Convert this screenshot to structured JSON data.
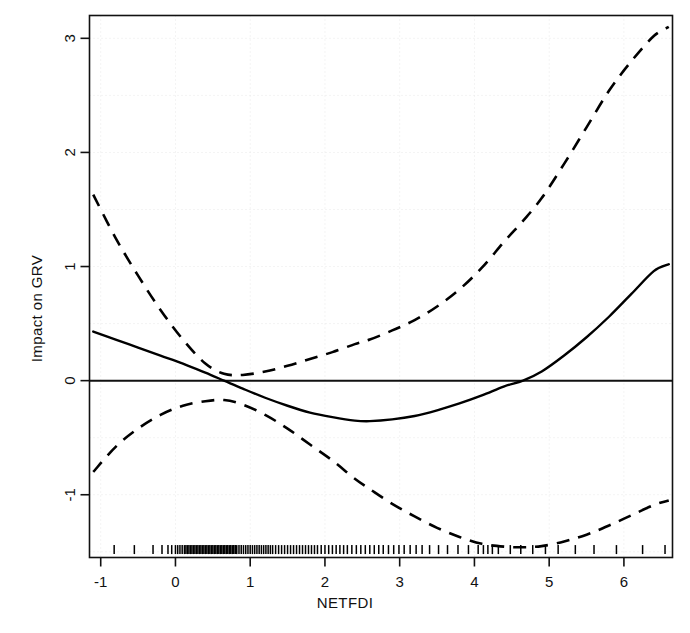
{
  "chart_data": {
    "type": "line",
    "title": "",
    "xlabel": "NETFDI",
    "ylabel": "Impact on GRV",
    "xlim": [
      -1.15,
      6.65
    ],
    "ylim": [
      -1.55,
      3.2
    ],
    "xticks": [
      -1,
      0,
      1,
      2,
      3,
      4,
      5,
      6
    ],
    "xticklabels": [
      "-1",
      "0",
      "1",
      "2",
      "3",
      "4",
      "5",
      "6"
    ],
    "yticks": [
      -1,
      0,
      1,
      2,
      3
    ],
    "yticklabels": [
      "-1",
      "0",
      "1",
      "2",
      "3"
    ],
    "grid": true,
    "grid_color": "#e8e8e8",
    "grid_style": "dotted",
    "legend": "none",
    "zero_line": 0,
    "x": [
      -1.1,
      -0.8,
      -0.5,
      -0.2,
      0.1,
      0.4,
      0.65,
      0.9,
      1.2,
      1.5,
      1.8,
      2.1,
      2.4,
      2.6,
      2.9,
      3.2,
      3.5,
      3.8,
      4.1,
      4.4,
      4.65,
      4.9,
      5.2,
      5.5,
      5.8,
      6.1,
      6.4,
      6.6
    ],
    "series": [
      {
        "name": "fitted effect",
        "style": "solid",
        "color": "#000000",
        "values": [
          0.43,
          0.36,
          0.29,
          0.22,
          0.15,
          0.07,
          0.0,
          -0.07,
          -0.15,
          -0.22,
          -0.28,
          -0.32,
          -0.35,
          -0.355,
          -0.34,
          -0.31,
          -0.26,
          -0.2,
          -0.13,
          -0.05,
          0.0,
          0.08,
          0.22,
          0.38,
          0.56,
          0.76,
          0.96,
          1.02
        ]
      },
      {
        "name": "upper confidence band",
        "style": "dashed",
        "color": "#000000",
        "values": [
          1.63,
          1.25,
          0.92,
          0.62,
          0.36,
          0.15,
          0.06,
          0.05,
          0.08,
          0.13,
          0.19,
          0.25,
          0.32,
          0.36,
          0.44,
          0.53,
          0.65,
          0.8,
          0.99,
          1.22,
          1.4,
          1.6,
          1.9,
          2.22,
          2.54,
          2.8,
          3.02,
          3.1
        ]
      },
      {
        "name": "lower confidence band",
        "style": "dashed",
        "color": "#000000",
        "values": [
          -0.8,
          -0.58,
          -0.42,
          -0.3,
          -0.22,
          -0.18,
          -0.17,
          -0.21,
          -0.3,
          -0.42,
          -0.56,
          -0.7,
          -0.86,
          -0.95,
          -1.08,
          -1.19,
          -1.29,
          -1.37,
          -1.43,
          -1.455,
          -1.46,
          -1.45,
          -1.41,
          -1.35,
          -1.27,
          -1.18,
          -1.09,
          -1.05
        ]
      }
    ],
    "rug": {
      "name": "data rug",
      "y": -1.52,
      "values": [
        -0.82,
        -0.55,
        -0.3,
        -0.18,
        -0.1,
        -0.05,
        0.0,
        0.03,
        0.06,
        0.09,
        0.12,
        0.14,
        0.16,
        0.18,
        0.2,
        0.22,
        0.24,
        0.26,
        0.28,
        0.3,
        0.32,
        0.34,
        0.36,
        0.38,
        0.4,
        0.42,
        0.44,
        0.46,
        0.48,
        0.5,
        0.52,
        0.54,
        0.56,
        0.58,
        0.6,
        0.62,
        0.64,
        0.66,
        0.68,
        0.7,
        0.72,
        0.74,
        0.76,
        0.78,
        0.8,
        0.82,
        0.85,
        0.88,
        0.91,
        0.94,
        0.97,
        1.0,
        1.03,
        1.06,
        1.09,
        1.12,
        1.15,
        1.18,
        1.21,
        1.24,
        1.27,
        1.3,
        1.34,
        1.38,
        1.42,
        1.46,
        1.5,
        1.54,
        1.58,
        1.62,
        1.66,
        1.7,
        1.74,
        1.78,
        1.82,
        1.86,
        1.9,
        1.95,
        2.0,
        2.05,
        2.1,
        2.15,
        2.2,
        2.25,
        2.3,
        2.36,
        2.42,
        2.48,
        2.54,
        2.6,
        2.66,
        2.72,
        2.78,
        2.85,
        2.92,
        2.99,
        3.06,
        3.14,
        3.22,
        3.3,
        3.4,
        3.52,
        3.64,
        3.78,
        3.92,
        4.05,
        4.12,
        4.18,
        4.24,
        4.32,
        4.48,
        4.62,
        4.78,
        4.95,
        5.12,
        5.35,
        5.6,
        5.9,
        6.25,
        6.55
      ]
    }
  },
  "figure": {
    "background": "#ffffff",
    "axis_color": "#111111",
    "line_color": "#000000"
  }
}
